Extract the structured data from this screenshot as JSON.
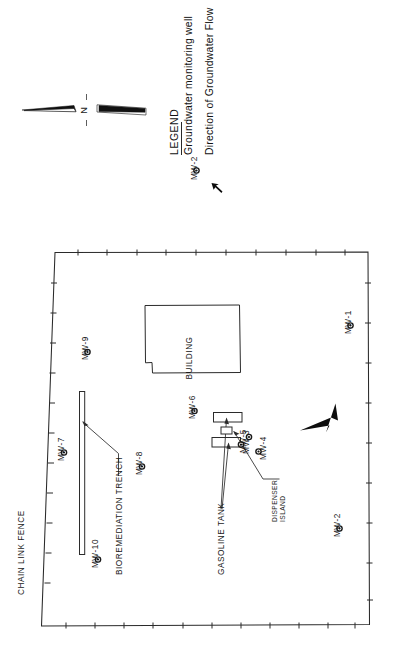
{
  "figure": {
    "orientation": "rotated-90-ccw",
    "background_color": "#ffffff",
    "ink_color": "#1a1a1a"
  },
  "north_arrow": {
    "label": "N",
    "name": "north-arrow"
  },
  "legend": {
    "title": "LEGEND",
    "items": [
      {
        "symbol": "filled-circle-well",
        "symbol_label": "MW-2",
        "description": "Groundwater monitoring well"
      },
      {
        "symbol": "solid-arrow",
        "symbol_label": "",
        "description": "Direction of Groundwater Flow"
      }
    ]
  },
  "site_plan": {
    "boundary_label": "CHAIN LINK FENCE",
    "features": [
      {
        "id": "building",
        "label": "BUILDING"
      },
      {
        "id": "gasoline-tank",
        "label": "GASOLINE TANK"
      },
      {
        "id": "dispenser-island",
        "label": "DISPENSER\nISLAND"
      },
      {
        "id": "dispenser-island-line1",
        "label": "DISPENSER"
      },
      {
        "id": "dispenser-island-line2",
        "label": "ISLAND"
      },
      {
        "id": "bioremediation-trench",
        "label": "BIOREMEDIATION TRENCH"
      }
    ],
    "flow_arrow": {
      "label": "Direction of Groundwater Flow",
      "direction": "toward-lower-left"
    },
    "monitoring_wells": [
      {
        "id": "MW-1",
        "label": "MW-1"
      },
      {
        "id": "MW-2",
        "label": "MW-2"
      },
      {
        "id": "MW-3",
        "label": "MW-3"
      },
      {
        "id": "MW-4",
        "label": "MW-4"
      },
      {
        "id": "MW-5",
        "label": "MW-5"
      },
      {
        "id": "MW-6",
        "label": "MW-6"
      },
      {
        "id": "MW-7",
        "label": "MW-7"
      },
      {
        "id": "MW-8",
        "label": "MW-8"
      },
      {
        "id": "MW-9",
        "label": "MW-9"
      },
      {
        "id": "MW-10",
        "label": "MW-10"
      }
    ]
  }
}
